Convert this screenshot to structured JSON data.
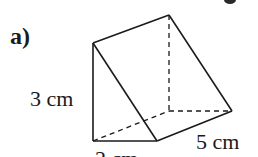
{
  "figure": {
    "part_label": "a)",
    "shape": "triangular prism",
    "labels": {
      "height": "3 cm",
      "width": "2 cm",
      "depth": "5 cm"
    },
    "colors": {
      "line": "#1a1a1a",
      "background": "#ffffff"
    }
  }
}
